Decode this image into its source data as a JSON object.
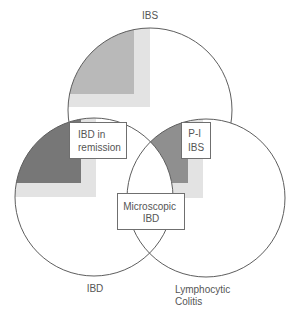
{
  "diagram": {
    "type": "venn",
    "colors": {
      "stroke": "#5e5e5e",
      "light_shade": "#e3e3e3",
      "ibs_dark_shade": "#b9b9b9",
      "ibd_dark_shade": "#777777",
      "lymphocytic_colitis_dark_shade": "#8f8f8f",
      "text": "#555555"
    },
    "sets": [
      {
        "id": "ibs",
        "label": "IBS"
      },
      {
        "id": "ibd",
        "label": "IBD"
      },
      {
        "id": "lymphocytic_colitis",
        "label_lines": [
          "Lymphocytic",
          "Colitis"
        ]
      }
    ],
    "overlap_boxes": {
      "ibd_in_remission": {
        "lines": [
          "IBD in",
          "remission"
        ],
        "between": [
          "IBS",
          "IBD"
        ]
      },
      "post_infectious_ibs": {
        "lines": [
          "P-I",
          "IBS"
        ],
        "between": [
          "IBS",
          "Lymphocytic Colitis"
        ]
      },
      "microscopic_ibd": {
        "lines": [
          "Microscopic",
          "IBD"
        ],
        "between": [
          "IBD",
          "Lymphocytic Colitis"
        ]
      }
    }
  }
}
